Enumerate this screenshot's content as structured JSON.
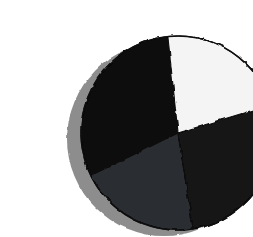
{
  "figure": {
    "title": "",
    "background_color": "#ffffff",
    "shadow_color": "#8d8d8d",
    "outline_color": "#0a0a0a",
    "center_x": 138,
    "center_y": 117,
    "radius": 97,
    "shadow_offset_x": -14,
    "shadow_offset_y": 6
  },
  "chart_data": {
    "type": "pie",
    "title": "",
    "subtitle": "",
    "xlabel": "",
    "ylabel": "",
    "legend_position": "none",
    "grid": false,
    "labels": [
      "Slice 1",
      "Slice 2",
      "Slice 3",
      "Slice 4"
    ],
    "values": [
      30.6,
      20.3,
      27.2,
      21.9
    ],
    "percentages": [
      "30.6%",
      "20.3%",
      "27.2%",
      "21.9%"
    ],
    "colors": [
      "#0d0d0d",
      "#2c2e30",
      "#151515",
      "#f4f4f4"
    ],
    "start_angle_deg": 96,
    "direction": "counterclockwise",
    "slices": [
      {
        "label": "Slice 1",
        "value": 30.6,
        "percent": "30.6%",
        "color": "#0d0d0d",
        "start_angle_deg": 96,
        "end_angle_deg": 206,
        "sweep_deg": 110,
        "position": "upper-left"
      },
      {
        "label": "Slice 2",
        "value": 20.3,
        "percent": "20.3%",
        "color": "#2c2e30",
        "start_angle_deg": 206,
        "end_angle_deg": 279,
        "sweep_deg": 73,
        "position": "lower-left"
      },
      {
        "label": "Slice 3",
        "value": 27.2,
        "percent": "27.2%",
        "color": "#151515",
        "start_angle_deg": 279,
        "end_angle_deg": 377,
        "sweep_deg": 98,
        "position": "lower-right"
      },
      {
        "label": "Slice 4",
        "value": 21.9,
        "percent": "21.9%",
        "color": "#f4f4f4",
        "start_angle_deg": 377,
        "end_angle_deg": 456,
        "sweep_deg": 79,
        "position": "upper-right"
      }
    ]
  }
}
